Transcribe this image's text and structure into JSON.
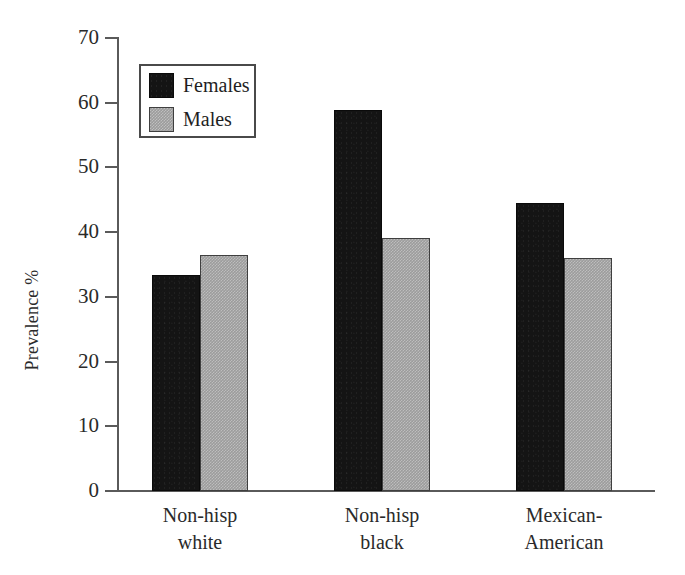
{
  "chart_data": {
    "type": "bar",
    "title": "",
    "xlabel": "",
    "ylabel": "Prevalence %",
    "ylim": [
      0,
      70
    ],
    "yticks": [
      0,
      10,
      20,
      30,
      40,
      50,
      60,
      70
    ],
    "ytick_labels": [
      "0",
      "10",
      "20",
      "30",
      "40",
      "50",
      "60",
      "70"
    ],
    "grid": false,
    "legend_position": "upper-left-inside",
    "categories": [
      "Non-hisp white",
      "Non-hisp black",
      "Mexican-American"
    ],
    "category_lines": [
      [
        "Non-hisp",
        "white"
      ],
      [
        "Non-hisp",
        "black"
      ],
      [
        "Mexican-",
        "American"
      ]
    ],
    "series": [
      {
        "name": "Females",
        "color": "#141414",
        "values": [
          33.4,
          58.8,
          44.5
        ]
      },
      {
        "name": "Males",
        "color": "#9c9c9c",
        "values": [
          36.4,
          39.1,
          36.0
        ]
      }
    ]
  },
  "legend": {
    "items": [
      {
        "label": "Females"
      },
      {
        "label": "Males"
      }
    ]
  },
  "axis": {
    "y_title": "Prevalence %"
  }
}
